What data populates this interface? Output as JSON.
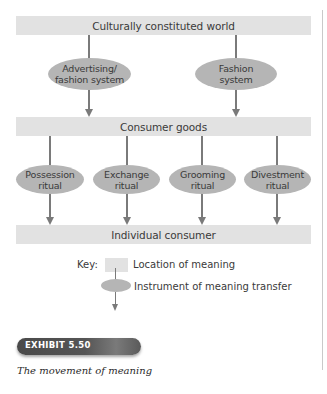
{
  "diagram": {
    "locations": {
      "top": "Culturally constituted world",
      "middle": "Consumer goods",
      "bottom": "Individual consumer"
    },
    "instruments_upper": [
      {
        "line1": "Advertising/",
        "line2": "fashion system"
      },
      {
        "line1": "Fashion",
        "line2": "system"
      }
    ],
    "instruments_lower": [
      {
        "line1": "Possession",
        "line2": "ritual"
      },
      {
        "line1": "Exchange",
        "line2": "ritual"
      },
      {
        "line1": "Grooming",
        "line2": "ritual"
      },
      {
        "line1": "Divestment",
        "line2": "ritual"
      }
    ]
  },
  "key": {
    "title": "Key:",
    "location_label": "Location of meaning",
    "instrument_label": "Instrument of meaning transfer"
  },
  "exhibit": {
    "badge": "EXHIBIT 5.50",
    "caption": "The movement of meaning"
  },
  "colors": {
    "location_fill": "#e2e2e2",
    "instrument_fill": "#b5b5b5",
    "arrow": "#7a7a7a",
    "badge": "#4a4a4a"
  }
}
